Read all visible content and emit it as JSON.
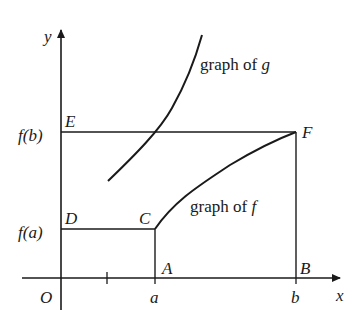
{
  "top_text_fragment": ")    (                    g          )",
  "axes": {
    "x_label": "x",
    "y_label": "y",
    "origin_label": "O"
  },
  "x_ticks": [
    "a",
    "b"
  ],
  "y_ticks": [
    "f(a)",
    "f(b)"
  ],
  "points": {
    "A": "A",
    "B": "B",
    "C": "C",
    "D": "D",
    "E": "E",
    "F": "F"
  },
  "curve_labels": {
    "g_prefix": "graph of ",
    "g_var": "g",
    "f_prefix": "graph of ",
    "f_var": "f"
  },
  "colors": {
    "ink": "#1a1a1a",
    "background": "#ffffff"
  }
}
